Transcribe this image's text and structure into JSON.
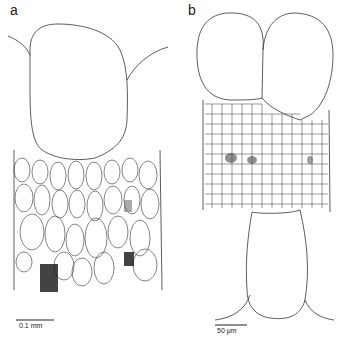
{
  "figure": {
    "panels": [
      {
        "label": "a",
        "scale_bar": "0.1 mm"
      },
      {
        "label": "b",
        "scale_bar": "50 μm"
      }
    ],
    "colors": {
      "line": "#333333",
      "background": "#ffffff",
      "stipple": "#222222"
    }
  }
}
